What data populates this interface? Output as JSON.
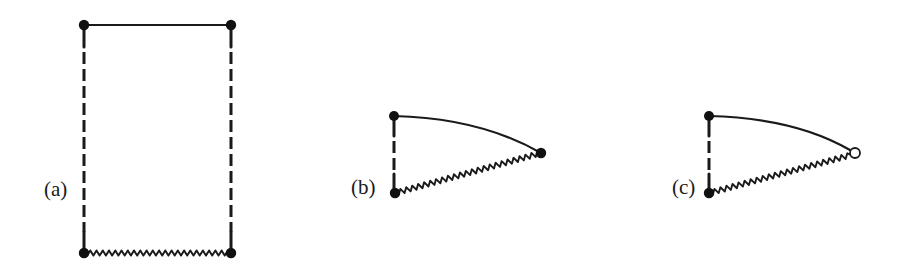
{
  "figure": {
    "panels": [
      {
        "label": "(a)",
        "description": "Rectangle diagram: solid top edge, dashed vertical sides, wavy bottom edge, four filled vertices",
        "vertices": [
          {
            "name": "top-left",
            "x": 84,
            "y": 25,
            "style": "filled"
          },
          {
            "name": "top-right",
            "x": 231,
            "y": 25,
            "style": "filled"
          },
          {
            "name": "bottom-left",
            "x": 84,
            "y": 253,
            "style": "filled"
          },
          {
            "name": "bottom-right",
            "x": 231,
            "y": 253,
            "style": "filled"
          }
        ],
        "edges": [
          {
            "from": "top-left",
            "to": "top-right",
            "style": "solid"
          },
          {
            "from": "top-left",
            "to": "bottom-left",
            "style": "dashed"
          },
          {
            "from": "top-right",
            "to": "bottom-right",
            "style": "dashed"
          },
          {
            "from": "bottom-left",
            "to": "bottom-right",
            "style": "wavy"
          }
        ]
      },
      {
        "label": "(b)",
        "description": "Triangle diagram: curved solid top edge, dashed vertical edge, wavy lower edge, three filled vertices",
        "vertices": [
          {
            "name": "top",
            "x": 394,
            "y": 116,
            "style": "filled"
          },
          {
            "name": "right",
            "x": 541,
            "y": 153,
            "style": "filled"
          },
          {
            "name": "bottom",
            "x": 395,
            "y": 193,
            "style": "filled"
          }
        ],
        "edges": [
          {
            "from": "top",
            "to": "right",
            "style": "solid-curved"
          },
          {
            "from": "top",
            "to": "bottom",
            "style": "dashed"
          },
          {
            "from": "bottom",
            "to": "right",
            "style": "wavy"
          }
        ]
      },
      {
        "label": "(c)",
        "description": "Triangle diagram like (b) but right vertex is an open circle",
        "vertices": [
          {
            "name": "top",
            "x": 709,
            "y": 116,
            "style": "filled"
          },
          {
            "name": "right",
            "x": 855,
            "y": 153,
            "style": "open"
          },
          {
            "name": "bottom",
            "x": 709,
            "y": 193,
            "style": "filled"
          }
        ],
        "edges": [
          {
            "from": "top",
            "to": "right",
            "style": "solid-curved"
          },
          {
            "from": "top",
            "to": "bottom",
            "style": "dashed"
          },
          {
            "from": "bottom",
            "to": "right",
            "style": "wavy"
          }
        ]
      }
    ],
    "colors": {
      "ink": "#1a1a1a",
      "background": "#ffffff"
    }
  }
}
